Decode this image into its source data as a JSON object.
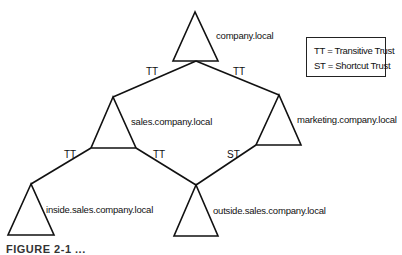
{
  "diagram": {
    "domains": [
      {
        "name": "company.local"
      },
      {
        "name": "sales.company.local"
      },
      {
        "name": "marketing.company.local"
      },
      {
        "name": "inside.sales.company.local"
      },
      {
        "name": "outside.sales.company.local"
      }
    ],
    "edges": [
      {
        "from": "company.local",
        "to": "sales.company.local",
        "label": "TT"
      },
      {
        "from": "company.local",
        "to": "marketing.company.local",
        "label": "TT"
      },
      {
        "from": "sales.company.local",
        "to": "inside.sales.company.local",
        "label": "TT"
      },
      {
        "from": "sales.company.local",
        "to": "outside.sales.company.local",
        "label": "TT"
      },
      {
        "from": "marketing.company.local",
        "to": "outside.sales.company.local",
        "label": "ST"
      }
    ],
    "legend": [
      {
        "text": "TT = Transitive Trust"
      },
      {
        "text": "ST = Shortcut Trust"
      }
    ],
    "caption": "FIGURE 2-1 ..."
  }
}
